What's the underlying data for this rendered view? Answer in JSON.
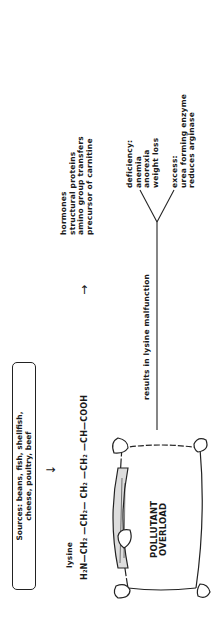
{
  "sources": {
    "line1": "Sources: beans, fish, shellfish,",
    "line2": "cheese, poultry, beef"
  },
  "arrows": {
    "down": "↓",
    "right": "→"
  },
  "lysine": {
    "label": "lysine",
    "formula": "H₂N—CH₂ —CH₂— CH₂ —CH₂ —CH—COOH"
  },
  "functions": {
    "lines": [
      "hormones",
      "structural proteins",
      "amino group transfers",
      "precursor of carnitine"
    ]
  },
  "overload": {
    "line1": "POLLUTANT",
    "line2": "OVERLOAD"
  },
  "malfunction": {
    "label": "results in lysine malfunction"
  },
  "deficiency": {
    "lines": [
      "deficiency:",
      "anemia",
      "anorexia",
      "weight loss"
    ]
  },
  "excess": {
    "lines": [
      "excess:",
      "urea forming enzyme",
      "reduces arginase"
    ]
  },
  "colors": {
    "ink": "#1a1a1a",
    "background": "#ffffff"
  }
}
